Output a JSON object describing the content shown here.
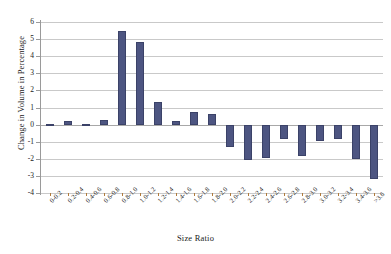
{
  "chart_data": {
    "type": "bar",
    "title": "",
    "xlabel": "Size Ratio",
    "ylabel": "Change in Volume in Percentage",
    "ylim": [
      -4,
      6
    ],
    "yticks": [
      6,
      5,
      4,
      3,
      2,
      1,
      0,
      -1,
      -2,
      -3,
      -4
    ],
    "ytick_labels": [
      "6",
      "5",
      "4",
      "3",
      "2",
      "1",
      "0",
      "-1",
      "-2",
      "-3",
      "-4"
    ],
    "grid": true,
    "legend": "none",
    "bar_color": "#4d5581",
    "gridline_color": "#c9c9c9",
    "categories": [
      "0-0.2",
      "0.2-0.4",
      "0.4-0.6",
      "0.6-0.8",
      "0.8-1.0",
      "1.0-1.2",
      "1.2-1.4",
      "1.4-1.6",
      "1.6-1.8",
      "1.8-2.0",
      "2.0-2.2",
      "2.2-2.4",
      "2.4-2.6",
      "2.6-2.8",
      "2.8-3.0",
      "3.0-3.2",
      "3.2-3.4",
      "3.4-3.6",
      ">3.6"
    ],
    "values": [
      0.02,
      0.22,
      0.03,
      0.24,
      5.5,
      4.85,
      1.35,
      0.2,
      0.72,
      0.62,
      -1.3,
      -2.05,
      -1.95,
      -0.85,
      -1.85,
      -0.95,
      -0.85,
      -2.0,
      -3.2
    ]
  }
}
